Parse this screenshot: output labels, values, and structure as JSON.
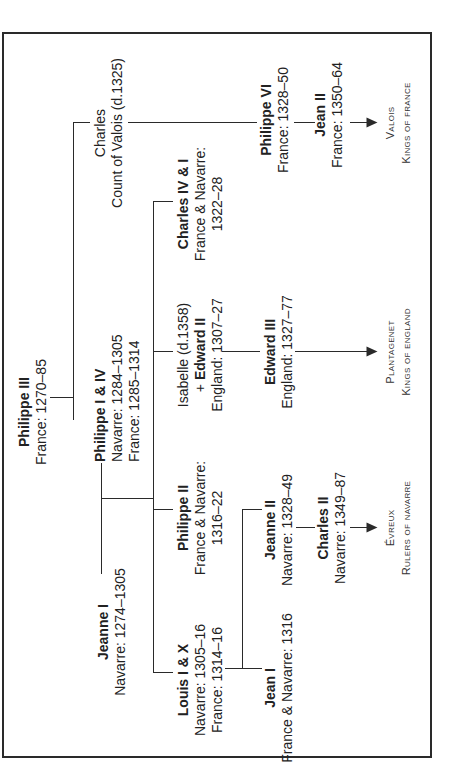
{
  "diagram": {
    "nodes": {
      "philippe3": {
        "name": "Philippe III",
        "lines": [
          "France: 1270–85"
        ]
      },
      "charles_valois": {
        "name": "Charles",
        "lines": [
          "Count of Valois (d.1325)"
        ]
      },
      "jeanne1": {
        "name": "Jeanne I",
        "lines": [
          "Navarre: 1274–1305"
        ]
      },
      "philippe1_4": {
        "name": "Philippe I & IV",
        "lines": [
          "Navarre: 1284–1305",
          "France: 1285–1314"
        ]
      },
      "louis1_10": {
        "name": "Louis I & X",
        "lines": [
          "Navarre: 1305–16",
          "France: 1314–16"
        ]
      },
      "philippe2": {
        "name": "Philippe II",
        "lines": [
          "France & Navarre:",
          "1316–22"
        ]
      },
      "isabelle": {
        "name": "Isabelle (d.1358)",
        "spouse_prefix": "+ ",
        "spouse": "Edward II",
        "lines": [
          "England: 1307–27"
        ]
      },
      "charles4_1": {
        "name": "Charles IV & I",
        "lines": [
          "France & Navarre:",
          "1322–28"
        ]
      },
      "philippe6": {
        "name": "Philippe VI",
        "lines": [
          "France: 1328–50"
        ]
      },
      "jean2": {
        "name": "Jean II",
        "lines": [
          "France: 1350–64"
        ]
      },
      "jean1": {
        "name": "Jean I",
        "lines": [
          "France & Navarre: 1316"
        ]
      },
      "jeanne2": {
        "name": "Jeanne II",
        "lines": [
          "Navarre: 1328–49"
        ]
      },
      "edward3": {
        "name": "Edward III",
        "lines": [
          "England: 1327–77"
        ]
      },
      "charles2": {
        "name": "Charles II",
        "lines": [
          "Navarre: 1349–87"
        ]
      }
    },
    "dynasties": {
      "valois": [
        "Valois",
        "Kings of France"
      ],
      "plantagenet": [
        "Plantagenet",
        "Kings of England"
      ],
      "evreux": [
        "Évreux",
        "Rulers of Navarre"
      ]
    },
    "colors": {
      "line": "#2a2a2a",
      "text": "#222222",
      "background": "#ffffff"
    }
  }
}
